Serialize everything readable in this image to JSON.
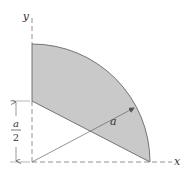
{
  "diagram": {
    "type": "quarter-circle region with chord cut",
    "colors": {
      "fill": "#c9c9c9",
      "stroke": "#555555",
      "axis": "#666666",
      "background": "#ffffff"
    },
    "axes": {
      "x_label": "x",
      "y_label": "y"
    },
    "radius_label": "a",
    "dimension": {
      "numerator": "a",
      "denominator": "2"
    }
  }
}
